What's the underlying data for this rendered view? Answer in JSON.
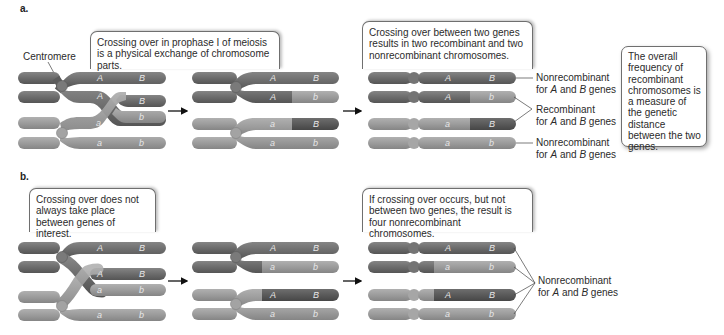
{
  "panels": {
    "a": {
      "label": "a.",
      "centromere_label": "Centromere",
      "bubble1": "Crossing over in prophase I of meiosis is a physical exchange of chromosome parts.",
      "bubble2": "Crossing over between two genes results in two recombinant and two nonrecombinant chromosomes.",
      "bubble3": "The overall frequency of recombinant chromosomes is a measure of the genetic distance between the two genes.",
      "result_labels": [
        {
          "line1": "Nonrecombinant",
          "line2_pre": "for ",
          "gene1": "A",
          "mid": " and ",
          "gene2": "B",
          "post": " genes"
        },
        {
          "line1": "Recombinant",
          "line2_pre": "for ",
          "gene1": "A",
          "mid": " and ",
          "gene2": "B",
          "post": " genes"
        },
        {
          "line1": "Nonrecombinant",
          "line2_pre": "for ",
          "gene1": "A",
          "mid": " and ",
          "gene2": "B",
          "post": " genes"
        }
      ],
      "final_chromosomes": [
        {
          "genes": [
            "A",
            "B"
          ],
          "type": "Nonrecombinant"
        },
        {
          "genes": [
            "A",
            "b"
          ],
          "type": "Recombinant"
        },
        {
          "genes": [
            "a",
            "B"
          ],
          "type": "Recombinant"
        },
        {
          "genes": [
            "a",
            "b"
          ],
          "type": "Nonrecombinant"
        }
      ]
    },
    "b": {
      "label": "b.",
      "bubble1": "Crossing over does not always take place between genes of interest.",
      "bubble2": "If crossing over occurs, but not between two genes, the result is four nonrecombinant chromosomes.",
      "result_label": {
        "line1": "Nonrecombinant",
        "line2_pre": "for ",
        "gene1": "A",
        "mid": " and ",
        "gene2": "B",
        "post": " genes"
      },
      "final_chromosomes": [
        {
          "genes": [
            "A",
            "B"
          ]
        },
        {
          "genes": [
            "a",
            "b"
          ]
        },
        {
          "genes": [
            "A",
            "B"
          ]
        },
        {
          "genes": [
            "a",
            "b"
          ]
        }
      ]
    }
  },
  "gene_letters": {
    "A": "A",
    "B": "B",
    "a": "a",
    "b": "b"
  },
  "colors": {
    "dark_chromosome": "#6c6c6c",
    "light_chromosome": "#9c9c9c",
    "centromere": "#8a8a8a",
    "text": "#2b2b2b",
    "gene_text": "#e8e8e8"
  }
}
